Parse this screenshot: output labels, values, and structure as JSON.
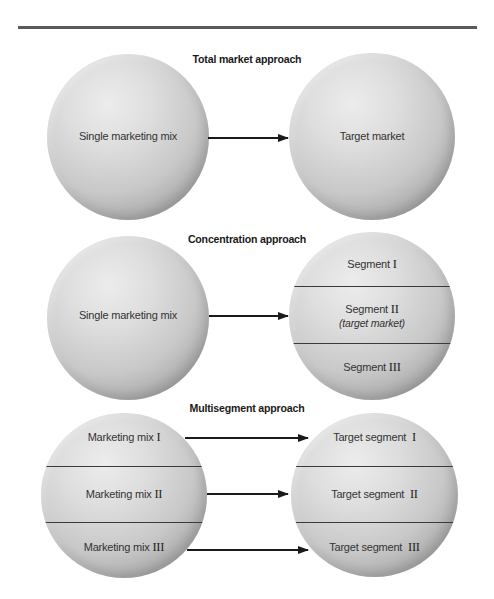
{
  "diagram": {
    "panels": [
      {
        "title": "Total market approach",
        "left": {
          "segments": [
            {
              "text": "Single marketing mix",
              "roman": ""
            }
          ]
        },
        "right": {
          "segments": [
            {
              "text": "Target market",
              "roman": ""
            }
          ]
        },
        "arrows": 1
      },
      {
        "title": "Concentration approach",
        "left": {
          "segments": [
            {
              "text": "Single marketing mix",
              "roman": ""
            }
          ]
        },
        "right": {
          "segments": [
            {
              "text": "Segment ",
              "roman": "I",
              "sub": ""
            },
            {
              "text": "Segment ",
              "roman": "II",
              "sub": "(target market)"
            },
            {
              "text": "Segment ",
              "roman": "III",
              "sub": ""
            }
          ]
        },
        "arrows": 1
      },
      {
        "title": "Multisegment approach",
        "left": {
          "segments": [
            {
              "text": "Marketing mix ",
              "roman": "I"
            },
            {
              "text": "Marketing mix ",
              "roman": "II"
            },
            {
              "text": "Marketing mix ",
              "roman": "III"
            }
          ]
        },
        "right": {
          "segments": [
            {
              "text": "Target segment  ",
              "roman": "I"
            },
            {
              "text": "Target segment  ",
              "roman": "II"
            },
            {
              "text": "Target segment  ",
              "roman": "III"
            }
          ]
        },
        "arrows": 3
      }
    ]
  },
  "colors": {
    "rule": "#5a5a5a",
    "sphere_highlight": "#ececec",
    "sphere_edge": "#8c8c8c",
    "line": "#1a1a1a"
  }
}
